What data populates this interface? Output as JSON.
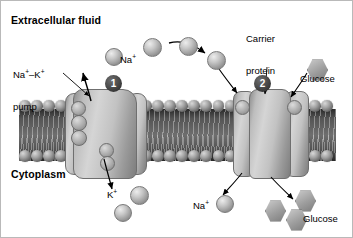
{
  "figure": {
    "title_top": "Extracellular fluid",
    "title_bottom": "Cytoplasm",
    "type": "cell-membrane-transport-diagram"
  },
  "labels": {
    "extracellular_fluid": "Extracellular fluid",
    "cytoplasm": "Cytoplasm",
    "na_k_pump_line1": "Na",
    "na_k_pump_line1_sup1": "+",
    "na_k_pump_dash": "–K",
    "na_k_pump_sup2": "+",
    "na_k_pump_line2": "pump",
    "carrier_protein_line1": "Carrier",
    "carrier_protein_line2": "protein",
    "glucose_top": "Glucose",
    "glucose_bottom": "Glucose",
    "sodium_top": "Na",
    "sodium_top_sup": "+",
    "sodium_bottom": "Na",
    "sodium_bottom_sup": "+",
    "potassium": "K",
    "potassium_sup": "+"
  },
  "markers": {
    "step_one": "1",
    "step_two": "2"
  },
  "colors": {
    "background": "#ffffff",
    "border": "#b9b9b9",
    "membrane_core": "#6e6e6e",
    "phospholipid_head": "#a2a2a2",
    "protein_fill": "#c2c2c2",
    "protein_outline": "#6f6f6f",
    "molecule_fill": "#c6c6c6",
    "marker_fill": "#3a3a3a",
    "marker_text": "#ffffff",
    "text": "#000000",
    "arrow": "#000000"
  },
  "molecules": {
    "sodium_extracellular_spheres": 3,
    "sodium_intracellular_spheres": 1,
    "potassium_spheres": 2,
    "glucose_extracellular_hexagons": 1,
    "glucose_intracellular_hexagons": 3,
    "glucose_transit_sphere": 1
  },
  "membrane": {
    "head_count_top": 26,
    "head_count_bottom": 26,
    "proteins": [
      "Na+-K+ pump",
      "Carrier protein"
    ]
  }
}
